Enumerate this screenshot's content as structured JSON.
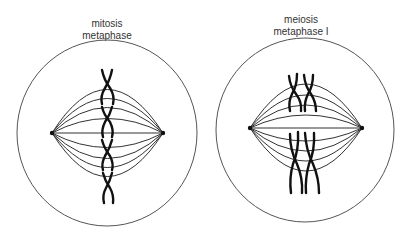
{
  "diagram": {
    "panels": [
      {
        "id": "mitosis",
        "title_line1": "mitosis",
        "title_line2": "metaphase",
        "chromosome_count": 4,
        "chromosome_arrangement": "single-file along metaphase plate"
      },
      {
        "id": "meiosis",
        "title_line1": "meiosis",
        "title_line2": "metaphase I",
        "chromosome_count": 4,
        "chromosome_arrangement": "homologous pairs (tetrads) aligned at metaphase plate"
      }
    ],
    "colors": {
      "background": "#ffffff",
      "cell_outline": "#555555",
      "spindle": "#333333",
      "chromosome": "#111111",
      "label_text": "#333333"
    }
  }
}
